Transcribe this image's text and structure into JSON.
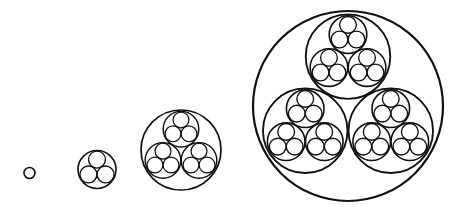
{
  "diagram": {
    "canvas": {
      "width": 462,
      "height": 208,
      "background": "#ffffff"
    },
    "stroke_color": "#111111",
    "subdivision": {
      "children_per_circle": 3,
      "arrangement": "triangle-one-top-two-bottom",
      "child_radius_ratio": 0.445,
      "child_offset_ratio": 0.52
    },
    "figures": [
      {
        "name": "level-0",
        "level": 0,
        "cx": 29.5,
        "cy": 173,
        "r": 5.5,
        "stroke_width": 1.6
      },
      {
        "name": "level-1",
        "level": 1,
        "cx": 97,
        "cy": 169.5,
        "r": 19,
        "stroke_width": 1.6
      },
      {
        "name": "level-2",
        "level": 2,
        "cx": 181,
        "cy": 150,
        "r": 40,
        "stroke_width": 1.7
      },
      {
        "name": "level-3",
        "level": 3,
        "cx": 348,
        "cy": 106,
        "r": 95,
        "stroke_width": 2.2
      }
    ]
  }
}
